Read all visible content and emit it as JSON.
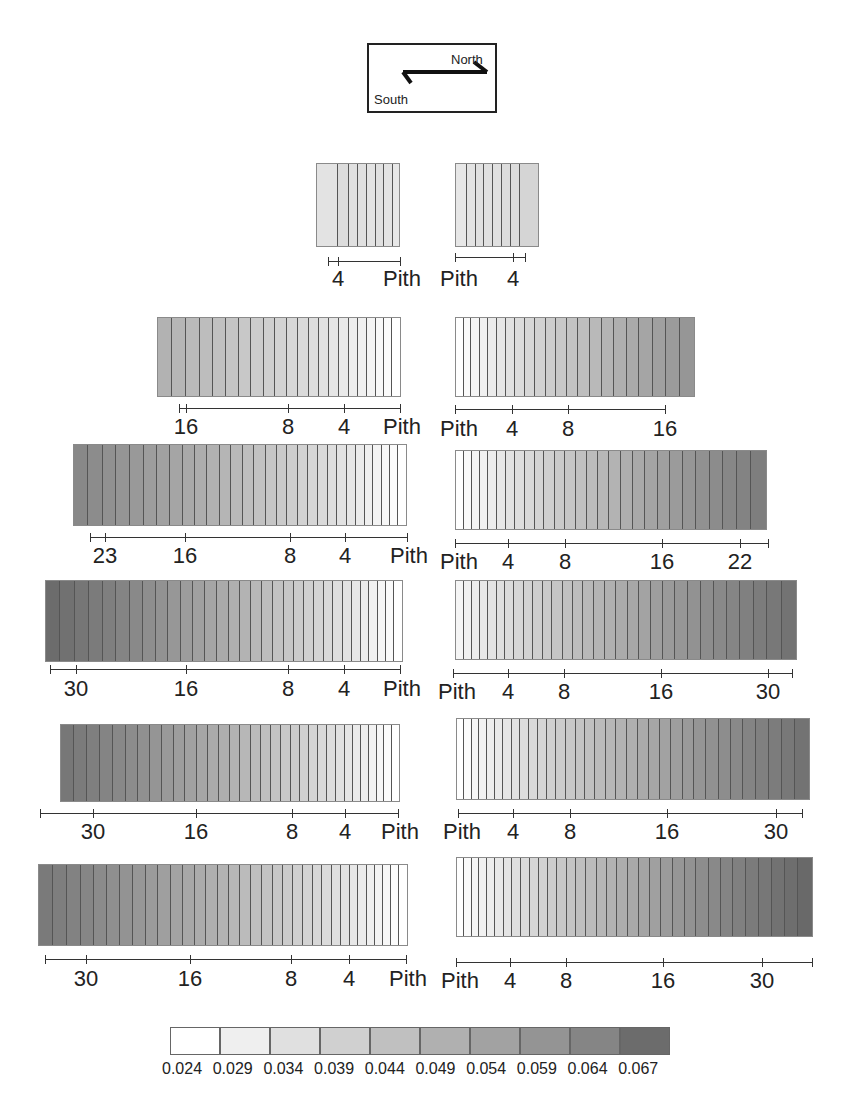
{
  "compass": {
    "north_label": "North",
    "south_label": "South"
  },
  "legend": {
    "values": [
      "0.024",
      "0.029",
      "0.034",
      "0.039",
      "0.044",
      "0.049",
      "0.054",
      "0.059",
      "0.064",
      "0.067"
    ],
    "colors": [
      "#ffffff",
      "#efefef",
      "#e0e0e0",
      "#d0d0d0",
      "#c0c0c0",
      "#b0b0b0",
      "#a2a2a2",
      "#949494",
      "#858585",
      "#6c6c6c"
    ]
  },
  "chart_data": {
    "type": "heatmap",
    "title": "",
    "legend_values": [
      0.024,
      0.029,
      0.034,
      0.039,
      0.044,
      0.049,
      0.054,
      0.059,
      0.064,
      0.067
    ],
    "rows": [
      {
        "south_ticks": [
          "4",
          "Pith"
        ],
        "north_ticks": [
          "Pith",
          "4"
        ]
      },
      {
        "south_ticks": [
          "16",
          "8",
          "4",
          "Pith"
        ],
        "north_ticks": [
          "Pith",
          "4",
          "8",
          "16"
        ]
      },
      {
        "south_ticks": [
          "23",
          "16",
          "8",
          "4",
          "Pith"
        ],
        "north_ticks": [
          "Pith",
          "4",
          "8",
          "16",
          "22"
        ]
      },
      {
        "south_ticks": [
          "30",
          "16",
          "8",
          "4",
          "Pith"
        ],
        "north_ticks": [
          "Pith",
          "4",
          "8",
          "16",
          "30"
        ]
      },
      {
        "south_ticks": [
          "30",
          "16",
          "8",
          "4",
          "Pith"
        ],
        "north_ticks": [
          "Pith",
          "4",
          "8",
          "16",
          "30"
        ]
      },
      {
        "south_ticks": [
          "30",
          "16",
          "8",
          "4",
          "Pith"
        ],
        "north_ticks": [
          "Pith",
          "4",
          "8",
          "16",
          "30"
        ]
      }
    ]
  },
  "panels": [
    {
      "side": "south",
      "x": 316,
      "y": 163,
      "w": 84,
      "h": 84,
      "rings": [
        0.032,
        0.034,
        0.033,
        0.033,
        0.032,
        0.033,
        0.032,
        0.031
      ],
      "widths": [
        22,
        11,
        9,
        9,
        9,
        9,
        9,
        6
      ],
      "axis": {
        "x1": 328,
        "x2": 400,
        "y": 261
      },
      "ticks": [
        {
          "x": 338,
          "label": "4"
        },
        {
          "x": 400,
          "label": "Pith"
        }
      ],
      "label_y": 268
    },
    {
      "side": "north",
      "x": 455,
      "y": 163,
      "w": 84,
      "h": 84,
      "rings": [
        0.031,
        0.032,
        0.033,
        0.033,
        0.033,
        0.034,
        0.034,
        0.036
      ],
      "widths": [
        11,
        9,
        9,
        9,
        9,
        9,
        10,
        18
      ],
      "axis": {
        "x1": 455,
        "x2": 525,
        "y": 257
      },
      "ticks": [
        {
          "x": 455,
          "label": "Pith"
        },
        {
          "x": 513,
          "label": "4"
        }
      ],
      "label_y": 268
    },
    {
      "side": "south",
      "x": 157,
      "y": 317,
      "w": 244,
      "h": 80,
      "ring_count": 22,
      "from": 0.046,
      "to": 0.024,
      "axis": {
        "x1": 179,
        "x2": 400,
        "y": 408
      },
      "ticks": [
        {
          "x": 186,
          "label": "16"
        },
        {
          "x": 288,
          "label": "8"
        },
        {
          "x": 344,
          "label": "4"
        },
        {
          "x": 400,
          "label": "Pith"
        }
      ],
      "label_y": 416
    },
    {
      "side": "north",
      "x": 455,
      "y": 317,
      "w": 240,
      "h": 80,
      "ring_count": 22,
      "from": 0.024,
      "to": 0.054,
      "axis": {
        "x1": 455,
        "x2": 665,
        "y": 409
      },
      "ticks": [
        {
          "x": 455,
          "label": "Pith"
        },
        {
          "x": 512,
          "label": "4"
        },
        {
          "x": 568,
          "label": "8"
        },
        {
          "x": 665,
          "label": "16"
        }
      ],
      "label_y": 418
    },
    {
      "side": "south",
      "x": 73,
      "y": 444,
      "w": 334,
      "h": 82,
      "ring_count": 30,
      "from": 0.058,
      "to": 0.024,
      "axis": {
        "x1": 90,
        "x2": 407,
        "y": 537
      },
      "ticks": [
        {
          "x": 105,
          "label": "23"
        },
        {
          "x": 185,
          "label": "16"
        },
        {
          "x": 290,
          "label": "8"
        },
        {
          "x": 345,
          "label": "4"
        },
        {
          "x": 407,
          "label": "Pith"
        }
      ],
      "label_y": 545
    },
    {
      "side": "north",
      "x": 455,
      "y": 450,
      "w": 312,
      "h": 80,
      "ring_count": 28,
      "from": 0.024,
      "to": 0.061,
      "axis": {
        "x1": 455,
        "x2": 768,
        "y": 543
      },
      "ticks": [
        {
          "x": 455,
          "label": "Pith"
        },
        {
          "x": 508,
          "label": "4"
        },
        {
          "x": 565,
          "label": "8"
        },
        {
          "x": 662,
          "label": "16"
        },
        {
          "x": 740,
          "label": "22"
        }
      ],
      "label_y": 551
    },
    {
      "side": "south",
      "x": 45,
      "y": 580,
      "w": 358,
      "h": 82,
      "ring_count": 32,
      "from": 0.066,
      "to": 0.024,
      "axis": {
        "x1": 50,
        "x2": 400,
        "y": 669
      },
      "ticks": [
        {
          "x": 76,
          "label": "30"
        },
        {
          "x": 186,
          "label": "16"
        },
        {
          "x": 288,
          "label": "8"
        },
        {
          "x": 344,
          "label": "4"
        },
        {
          "x": 400,
          "label": "Pith"
        }
      ],
      "label_y": 678
    },
    {
      "side": "north",
      "x": 455,
      "y": 580,
      "w": 342,
      "h": 80,
      "ring_count": 31,
      "from": 0.027,
      "to": 0.064,
      "axis": {
        "x1": 453,
        "x2": 792,
        "y": 673
      },
      "ticks": [
        {
          "x": 453,
          "label": "Pith"
        },
        {
          "x": 508,
          "label": "4"
        },
        {
          "x": 564,
          "label": "8"
        },
        {
          "x": 661,
          "label": "16"
        },
        {
          "x": 768,
          "label": "30"
        }
      ],
      "label_y": 681
    },
    {
      "side": "south",
      "x": 60,
      "y": 724,
      "w": 340,
      "h": 78,
      "ring_count": 33,
      "from": 0.063,
      "to": 0.024,
      "axis": {
        "x1": 40,
        "x2": 398,
        "y": 813
      },
      "ticks": [
        {
          "x": 93,
          "label": "30"
        },
        {
          "x": 196,
          "label": "16"
        },
        {
          "x": 292,
          "label": "8"
        },
        {
          "x": 345,
          "label": "4"
        },
        {
          "x": 398,
          "label": "Pith"
        }
      ],
      "label_y": 821
    },
    {
      "side": "north",
      "x": 456,
      "y": 718,
      "w": 354,
      "h": 82,
      "ring_count": 34,
      "from": 0.024,
      "to": 0.064,
      "axis": {
        "x1": 458,
        "x2": 802,
        "y": 813
      },
      "ticks": [
        {
          "x": 458,
          "label": "Pith"
        },
        {
          "x": 513,
          "label": "4"
        },
        {
          "x": 570,
          "label": "8"
        },
        {
          "x": 667,
          "label": "16"
        },
        {
          "x": 776,
          "label": "30"
        }
      ],
      "label_y": 821
    },
    {
      "side": "south",
      "x": 38,
      "y": 864,
      "w": 370,
      "h": 82,
      "ring_count": 34,
      "from": 0.062,
      "to": 0.024,
      "axis": {
        "x1": 45,
        "x2": 406,
        "y": 959
      },
      "ticks": [
        {
          "x": 86,
          "label": "30"
        },
        {
          "x": 190,
          "label": "16"
        },
        {
          "x": 291,
          "label": "8"
        },
        {
          "x": 349,
          "label": "4"
        },
        {
          "x": 406,
          "label": "Pith"
        }
      ],
      "label_y": 968
    },
    {
      "side": "north",
      "x": 456,
      "y": 857,
      "w": 357,
      "h": 80,
      "ring_count": 34,
      "from": 0.024,
      "to": 0.067,
      "axis": {
        "x1": 456,
        "x2": 812,
        "y": 962
      },
      "ticks": [
        {
          "x": 456,
          "label": "Pith"
        },
        {
          "x": 510,
          "label": "4"
        },
        {
          "x": 566,
          "label": "8"
        },
        {
          "x": 663,
          "label": "16"
        },
        {
          "x": 762,
          "label": "30"
        }
      ],
      "label_y": 970
    }
  ]
}
